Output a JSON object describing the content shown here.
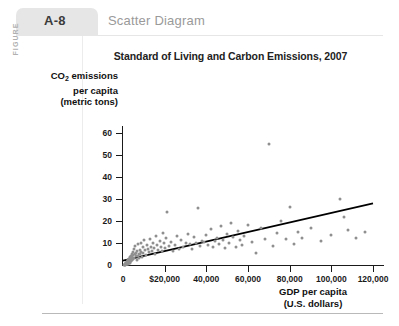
{
  "figure": {
    "vertical_label": "FIGURE",
    "number": "A-8",
    "caption": "Scatter Diagram"
  },
  "chart_data": {
    "type": "scatter",
    "title": "Standard of Living and Carbon Emissions, 2007",
    "xlabel_line1": "GDP per capita",
    "xlabel_line2": "(U.S. dollars)",
    "ylabel_line1": "CO2 emissions",
    "ylabel_line2": "per capita",
    "ylabel_line3": "(metric tons)",
    "ylabel_prefix": "CO",
    "ylabel_subscript": "2",
    "ylabel_suffix": " emissions",
    "xlim": [
      0,
      120000
    ],
    "ylim": [
      0,
      60
    ],
    "grid": false,
    "legend": "none",
    "x_ticks": [
      0,
      20000,
      40000,
      60000,
      80000,
      100000,
      120000
    ],
    "x_tick_labels": [
      "0",
      "$20,000",
      "40,000",
      "60,000",
      "80,000",
      "100,000",
      "120,000"
    ],
    "y_ticks": [
      0,
      10,
      20,
      30,
      40,
      50,
      60
    ],
    "y_tick_labels": [
      "0",
      "10",
      "20",
      "30",
      "40",
      "50",
      "60"
    ],
    "marker_color": "#8f8f8f",
    "trendline_color": "#000000",
    "trendline": {
      "x0": 0,
      "y0": 2.0,
      "x1": 120000,
      "y1": 28.0
    },
    "points": [
      [
        600,
        0.2
      ],
      [
        800,
        0.3
      ],
      [
        900,
        0.1
      ],
      [
        1000,
        0.4
      ],
      [
        1100,
        0.2
      ],
      [
        1200,
        0.6
      ],
      [
        1300,
        0.3
      ],
      [
        1400,
        0.8
      ],
      [
        1500,
        0.5
      ],
      [
        1600,
        1.0
      ],
      [
        1700,
        0.4
      ],
      [
        1800,
        1.2
      ],
      [
        1900,
        0.7
      ],
      [
        2000,
        1.5
      ],
      [
        2100,
        0.9
      ],
      [
        2200,
        1.8
      ],
      [
        2300,
        0.6
      ],
      [
        2400,
        2.1
      ],
      [
        2500,
        1.1
      ],
      [
        2600,
        2.4
      ],
      [
        2700,
        1.4
      ],
      [
        2800,
        0.8
      ],
      [
        2900,
        2.8
      ],
      [
        3000,
        1.7
      ],
      [
        3100,
        3.2
      ],
      [
        3200,
        1.0
      ],
      [
        3300,
        2.2
      ],
      [
        3400,
        3.6
      ],
      [
        3500,
        1.3
      ],
      [
        3600,
        2.6
      ],
      [
        3800,
        4.0
      ],
      [
        3900,
        1.9
      ],
      [
        4000,
        3.0
      ],
      [
        4200,
        5.2
      ],
      [
        4300,
        2.3
      ],
      [
        4500,
        3.8
      ],
      [
        4600,
        6.0
      ],
      [
        4800,
        2.7
      ],
      [
        5000,
        4.4
      ],
      [
        5200,
        7.4
      ],
      [
        5400,
        3.3
      ],
      [
        5600,
        5.0
      ],
      [
        5800,
        8.8
      ],
      [
        6000,
        3.9
      ],
      [
        6200,
        5.6
      ],
      [
        6500,
        2.5
      ],
      [
        6800,
        6.4
      ],
      [
        7000,
        4.2
      ],
      [
        7200,
        9.4
      ],
      [
        7500,
        5.2
      ],
      [
        7800,
        3.1
      ],
      [
        8000,
        7.0
      ],
      [
        8200,
        4.8
      ],
      [
        8500,
        10.2
      ],
      [
        8800,
        6.0
      ],
      [
        9000,
        3.5
      ],
      [
        9400,
        8.0
      ],
      [
        9800,
        5.4
      ],
      [
        10200,
        11.6
      ],
      [
        10600,
        6.8
      ],
      [
        11000,
        4.6
      ],
      [
        11500,
        9.0
      ],
      [
        12000,
        7.2
      ],
      [
        12500,
        5.8
      ],
      [
        13000,
        12.0
      ],
      [
        13500,
        8.4
      ],
      [
        14000,
        6.2
      ],
      [
        14500,
        10.0
      ],
      [
        15000,
        7.6
      ],
      [
        15500,
        5.0
      ],
      [
        16000,
        13.4
      ],
      [
        16500,
        9.2
      ],
      [
        17000,
        7.0
      ],
      [
        17500,
        11.0
      ],
      [
        18000,
        8.2
      ],
      [
        18500,
        6.4
      ],
      [
        19000,
        14.6
      ],
      [
        19500,
        9.8
      ],
      [
        20000,
        7.8
      ],
      [
        20500,
        12.2
      ],
      [
        21000,
        24.0
      ],
      [
        22000,
        8.6
      ],
      [
        23000,
        10.6
      ],
      [
        24000,
        6.6
      ],
      [
        25000,
        9.0
      ],
      [
        26000,
        13.0
      ],
      [
        27000,
        7.4
      ],
      [
        28000,
        11.4
      ],
      [
        29000,
        8.0
      ],
      [
        30000,
        10.2
      ],
      [
        31000,
        14.2
      ],
      [
        32000,
        9.4
      ],
      [
        33000,
        7.2
      ],
      [
        34000,
        12.6
      ],
      [
        35000,
        9.8
      ],
      [
        36000,
        26.0
      ],
      [
        37000,
        8.8
      ],
      [
        38000,
        11.0
      ],
      [
        39000,
        10.4
      ],
      [
        40000,
        13.8
      ],
      [
        41000,
        9.2
      ],
      [
        42000,
        16.2
      ],
      [
        43000,
        8.4
      ],
      [
        44000,
        10.8
      ],
      [
        45000,
        12.4
      ],
      [
        46000,
        9.6
      ],
      [
        47000,
        17.6
      ],
      [
        48000,
        11.2
      ],
      [
        49000,
        7.6
      ],
      [
        50000,
        14.0
      ],
      [
        51000,
        10.0
      ],
      [
        52000,
        19.0
      ],
      [
        53000,
        12.8
      ],
      [
        54000,
        8.2
      ],
      [
        55000,
        15.4
      ],
      [
        56000,
        11.6
      ],
      [
        57000,
        9.0
      ],
      [
        58000,
        13.2
      ],
      [
        60000,
        18.0
      ],
      [
        62000,
        10.6
      ],
      [
        64000,
        5.4
      ],
      [
        66000,
        16.8
      ],
      [
        68000,
        12.0
      ],
      [
        70000,
        55.0
      ],
      [
        72000,
        8.6
      ],
      [
        74000,
        14.4
      ],
      [
        76000,
        20.0
      ],
      [
        78000,
        11.8
      ],
      [
        80000,
        26.4
      ],
      [
        82000,
        9.4
      ],
      [
        84000,
        15.0
      ],
      [
        86000,
        12.2
      ],
      [
        90000,
        17.0
      ],
      [
        95000,
        10.8
      ],
      [
        100000,
        13.6
      ],
      [
        104000,
        30.0
      ],
      [
        106000,
        22.0
      ],
      [
        108000,
        16.0
      ],
      [
        112000,
        12.4
      ],
      [
        116000,
        14.8
      ]
    ]
  }
}
